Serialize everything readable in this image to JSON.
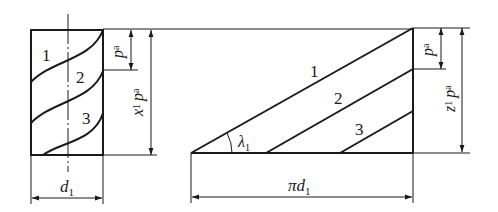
{
  "diagram": {
    "colors": {
      "stroke": "#1a1a1a",
      "background": "#ffffff"
    },
    "left_view": {
      "thread_labels": [
        "1",
        "2",
        "3"
      ],
      "diameter_label": {
        "main": "d",
        "sub": "1"
      },
      "pitch_label": {
        "main": "p",
        "sub": "a"
      },
      "lead_label": {
        "pre": "x",
        "pre_sub": "1",
        "main": "p",
        "sub": "a"
      }
    },
    "right_view": {
      "thread_labels": [
        "1",
        "2",
        "3"
      ],
      "angle_label": {
        "main": "λ",
        "sub": "1"
      },
      "circumference_label": {
        "main": "πd",
        "sub": "1"
      },
      "pitch_label": {
        "main": "p",
        "sub": "a"
      },
      "lead_label": {
        "pre": "z",
        "pre_sub": "1",
        "main": "p",
        "sub": "a"
      }
    }
  }
}
